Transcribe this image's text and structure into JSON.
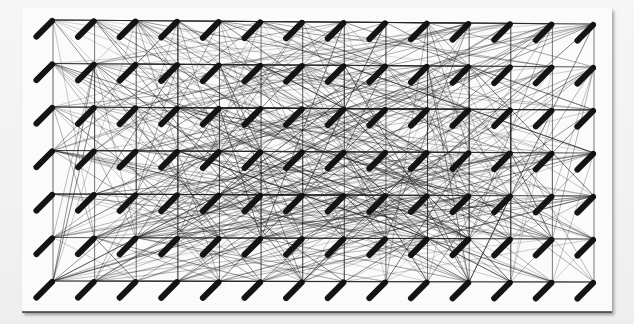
{
  "artwork": {
    "type": "string-art installation",
    "description": "Black thread stretched between a grid of pins on a white panel, each pin with an angled black spool",
    "grid": {
      "columns": 14,
      "rows": 7,
      "x_left": 53,
      "x_right": 594,
      "y_top_left": 20,
      "y_top_right": 24,
      "y_bottom_left": 281,
      "y_bottom_right": 282
    },
    "spool": {
      "length": 22,
      "thickness": 6,
      "angle_deg": 135,
      "color": "#141414"
    },
    "thread": {
      "color": "#1a1a1a",
      "count": 520,
      "seed": 7
    },
    "panel_color": "#fbfbfb",
    "background_color": "#f4f4f4"
  }
}
